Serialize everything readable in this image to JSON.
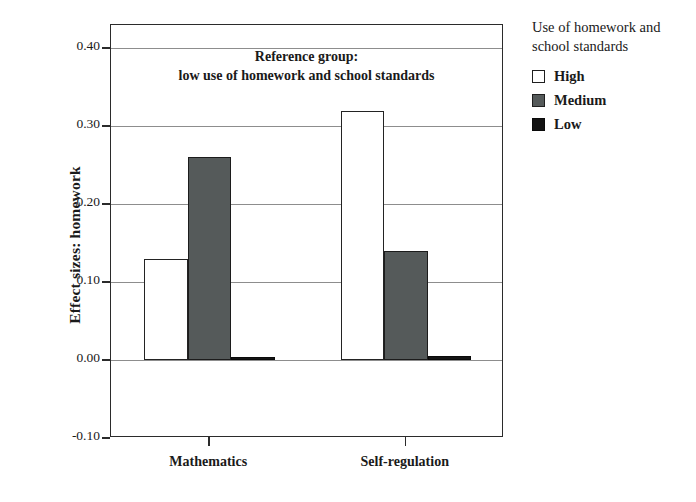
{
  "chart_data": {
    "type": "bar",
    "title": "",
    "xlabel": "",
    "ylabel": "Effect sizes: homework",
    "categories": [
      "Mathematics",
      "Self-regulation"
    ],
    "series": [
      {
        "name": "High",
        "values": [
          0.13,
          0.32
        ],
        "color": "#ffffff"
      },
      {
        "name": "Medium",
        "values": [
          0.26,
          0.14
        ],
        "color": "#555a5a"
      },
      {
        "name": "Low",
        "values": [
          0.004,
          0.005
        ],
        "color": "#131313"
      }
    ],
    "ylim": [
      -0.1,
      0.43
    ],
    "yticks": [
      0.4,
      0.3,
      0.2,
      0.1,
      0.0,
      -0.1
    ],
    "ytick_labels": [
      "0.40",
      "0.30",
      "0.20",
      "0.10",
      "0.00",
      "-0.10"
    ],
    "grid": true,
    "legend_position": "right-outside",
    "annotations": [
      "Reference group:",
      "low use of homework and school standards"
    ]
  },
  "legend": {
    "title_line1": "Use of homework and",
    "title_line2": "school standards",
    "entries": [
      {
        "label": "High",
        "swatch": "white-square-swatch"
      },
      {
        "label": "Medium",
        "swatch": "gray-square-swatch"
      },
      {
        "label": "Low",
        "swatch": "black-square-swatch"
      }
    ]
  },
  "axis": {
    "y_title": "Effect sizes: homework",
    "y_tick_labels": [
      "0.40",
      "0.30",
      "0.20",
      "0.10",
      "0.00",
      "-0.10"
    ],
    "x_tick_labels": [
      "Mathematics",
      "Self-regulation"
    ]
  },
  "annotation": {
    "line1": "Reference group:",
    "line2": "low use of homework and school standards"
  }
}
